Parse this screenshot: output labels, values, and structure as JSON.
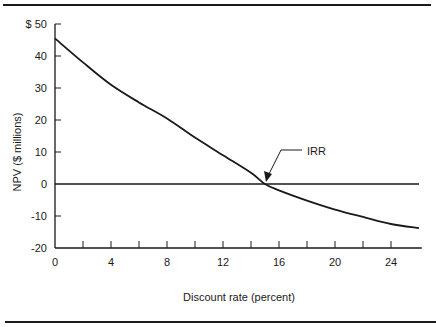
{
  "chart_data": {
    "type": "line",
    "title": "",
    "xlabel": "Discount rate (percent)",
    "ylabel": "NPV ($ millions)",
    "xlim": [
      0,
      26
    ],
    "ylim": [
      -20,
      50
    ],
    "x_ticks": [
      0,
      4,
      8,
      12,
      16,
      20,
      24
    ],
    "x_tick_labels": [
      "0",
      "4",
      "8",
      "12",
      "16",
      "20",
      "24"
    ],
    "x_minor_ticks": [
      2,
      4,
      6,
      8,
      10,
      12,
      14,
      16,
      18,
      20,
      22,
      24
    ],
    "y_ticks": [
      50,
      40,
      30,
      20,
      10,
      0,
      -10,
      -20
    ],
    "y_tick_labels": [
      "$ 50",
      "40",
      "30",
      "20",
      "10",
      "0",
      "-10",
      "-20"
    ],
    "grid": false,
    "legend": null,
    "series": [
      {
        "name": "NPV",
        "x": [
          0,
          2,
          4,
          6,
          8,
          10,
          12,
          14,
          15,
          16,
          18,
          20,
          22,
          24,
          26
        ],
        "values": [
          45.5,
          38,
          31,
          25.5,
          20.5,
          14.5,
          9,
          3.5,
          0,
          -2,
          -5.2,
          -8,
          -10.3,
          -12.5,
          -13.8
        ]
      },
      {
        "name": "Zero line",
        "x": [
          0,
          26
        ],
        "values": [
          0,
          0
        ]
      }
    ],
    "annotations": [
      {
        "text": "IRR",
        "x": 15,
        "y": 0,
        "description": "Arrow pointing to where NPV curve crosses zero (~15%)"
      }
    ]
  },
  "colors": {
    "ink": "#1a1a1a",
    "background": "#ffffff"
  }
}
